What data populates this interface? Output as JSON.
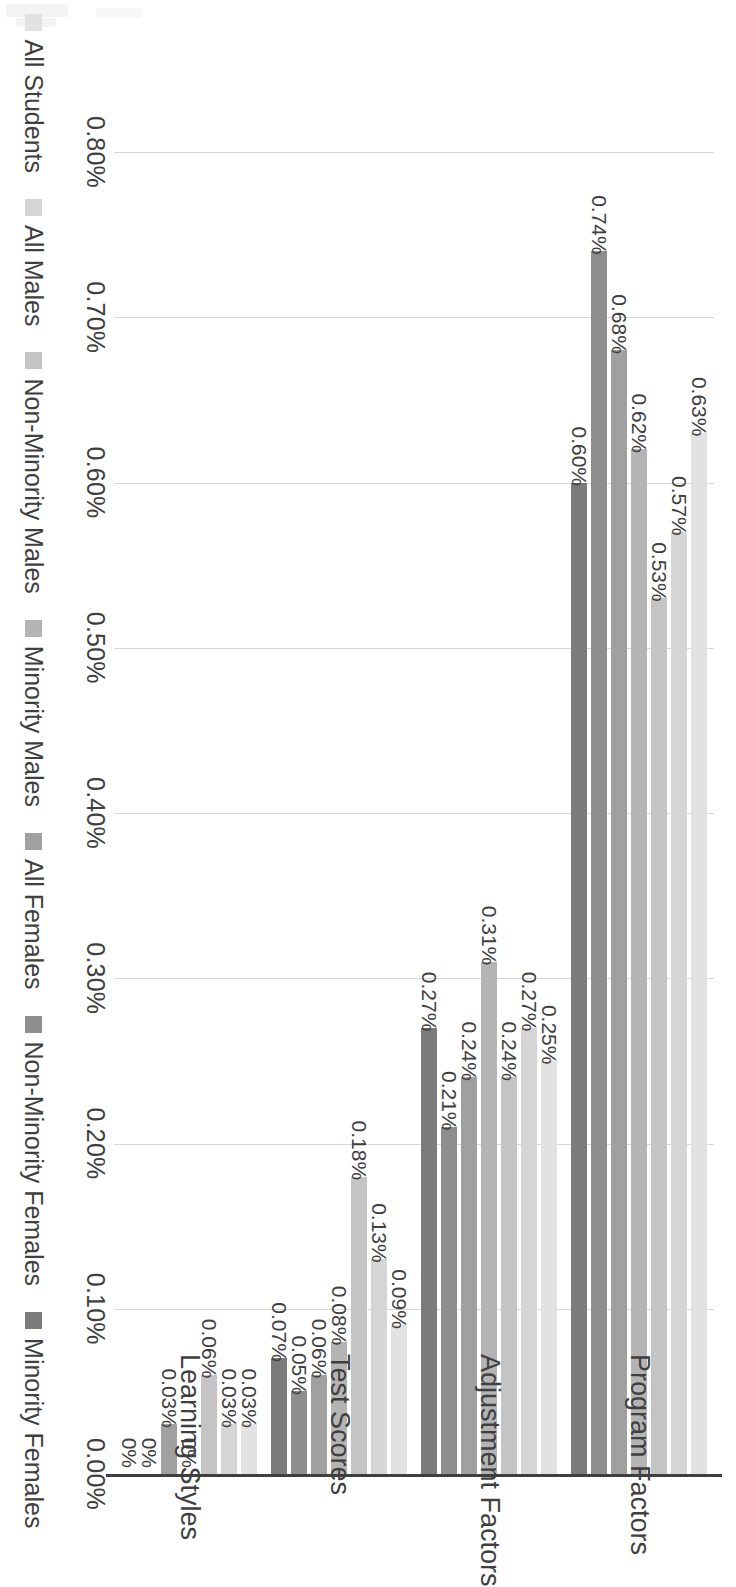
{
  "chart_data": {
    "type": "bar",
    "orientation": "horizontal",
    "title": "",
    "xlabel": "",
    "ylabel": "",
    "categories": [
      "Program Factors",
      "Adjustment Factors",
      "Test Scores",
      "Learning Styles"
    ],
    "value_axis_ticks": [
      "0.00%",
      "0.10%",
      "0.20%",
      "0.30%",
      "0.40%",
      "0.50%",
      "0.60%",
      "0.70%",
      "0.80%"
    ],
    "value_axis_tick_numbers": [
      0.0,
      0.1,
      0.2,
      0.3,
      0.4,
      0.5,
      0.6,
      0.7,
      0.8
    ],
    "xlim": [
      0,
      0.8
    ],
    "grid": true,
    "legend_position": "bottom",
    "series": [
      {
        "name": "All Students",
        "color": "#e2e2e2",
        "values": [
          0.63,
          0.25,
          0.09,
          0.03
        ],
        "labels": [
          "0.63%",
          "0.25%",
          "0.09%",
          "0.03%"
        ]
      },
      {
        "name": "All Males",
        "color": "#d5d5d5",
        "values": [
          0.57,
          0.27,
          0.13,
          0.03
        ],
        "labels": [
          "0.57%",
          "0.27%",
          "0.13%",
          "0.03%"
        ]
      },
      {
        "name": "Non-Minority Males",
        "color": "#c4c4c4",
        "values": [
          0.53,
          0.24,
          0.18,
          0.06
        ],
        "labels": [
          "0.53%",
          "0.24%",
          "0.18%",
          "0.06%"
        ]
      },
      {
        "name": "Minority Males",
        "color": "#b4b4b4",
        "values": [
          0.62,
          0.31,
          0.08,
          0.0
        ],
        "labels": [
          "0.62%",
          "0.31%",
          "0.08%",
          "0%"
        ]
      },
      {
        "name": "All Females",
        "color": "#a0a0a0",
        "values": [
          0.68,
          0.24,
          0.06,
          0.03
        ],
        "labels": [
          "0.68%",
          "0.24%",
          "0.06%",
          "0.03%"
        ]
      },
      {
        "name": "Non-Minority Females",
        "color": "#8e8e8e",
        "values": [
          0.74,
          0.21,
          0.05,
          0.0
        ],
        "labels": [
          "0.74%",
          "0.21%",
          "0.05%",
          "0%"
        ]
      },
      {
        "name": "Minority Females",
        "color": "#7b7b7b",
        "values": [
          0.6,
          0.27,
          0.07,
          0.0
        ],
        "labels": [
          "0.60%",
          "0.27%",
          "0.07%",
          "0%"
        ]
      }
    ]
  },
  "axis": {
    "ticks": [
      "0.00%",
      "0.10%",
      "0.20%",
      "0.30%",
      "0.40%",
      "0.50%",
      "0.60%",
      "0.70%",
      "0.80%"
    ]
  },
  "categories": [
    "Program Factors",
    "Adjustment Factors",
    "Test Scores",
    "Learning Styles"
  ],
  "legend": {
    "items": [
      {
        "label": "All Students",
        "color": "#e2e2e2"
      },
      {
        "label": "All Males",
        "color": "#d5d5d5"
      },
      {
        "label": "Non-Minority Males",
        "color": "#c4c4c4"
      },
      {
        "label": "Minority Males",
        "color": "#b4b4b4"
      },
      {
        "label": "All Females",
        "color": "#a0a0a0"
      },
      {
        "label": "Non-Minority Females",
        "color": "#8e8e8e"
      },
      {
        "label": "Minority Females",
        "color": "#7b7b7b"
      }
    ]
  },
  "colors": {
    "grid": "#d9d9d9",
    "axis": "#3f3f3f",
    "text": "#3f3f3f",
    "background": "#ffffff"
  }
}
